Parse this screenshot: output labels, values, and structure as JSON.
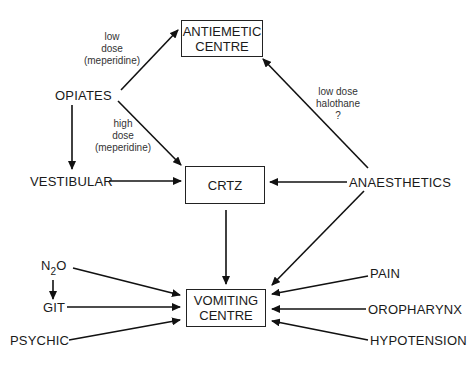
{
  "diagram": {
    "type": "flow",
    "boxes": {
      "antiemetic": {
        "line1": "ANTIEMETIC",
        "line2": "CENTRE"
      },
      "crtz": {
        "label": "CRTZ"
      },
      "vomiting": {
        "line1": "VOMITING",
        "line2": "CENTRE"
      }
    },
    "nodes": {
      "opiates": "OPIATES",
      "vestibular": "VESTIBULAR",
      "anaesthetics": "ANAESTHETICS",
      "n2o_n": "N",
      "n2o_sub": "2",
      "n2o_o": "O",
      "git": "GIT",
      "psychic": "PSYCHIC",
      "pain": "PAIN",
      "oropharynx": "OROPHARYNX",
      "hypotension": "HYPOTENSION"
    },
    "annotations": {
      "low_dose": {
        "l1": "low",
        "l2": "dose",
        "l3": "(meperidine)"
      },
      "high_dose": {
        "l1": "high",
        "l2": "dose",
        "l3": "(meperidine)"
      },
      "halothane": {
        "l1": "low dose",
        "l2": "halothane",
        "l3": "?"
      }
    },
    "edges": [
      {
        "from": "OPIATES",
        "to": "ANTIEMETIC CENTRE",
        "label": "low dose (meperidine)"
      },
      {
        "from": "OPIATES",
        "to": "CRTZ",
        "label": "high dose (meperidine)"
      },
      {
        "from": "OPIATES",
        "to": "VESTIBULAR"
      },
      {
        "from": "VESTIBULAR",
        "to": "CRTZ"
      },
      {
        "from": "ANAESTHETICS",
        "to": "ANTIEMETIC CENTRE",
        "label": "low dose halothane ?"
      },
      {
        "from": "ANAESTHETICS",
        "to": "CRTZ"
      },
      {
        "from": "ANAESTHETICS",
        "to": "VOMITING CENTRE"
      },
      {
        "from": "CRTZ",
        "to": "VOMITING CENTRE"
      },
      {
        "from": "N2O",
        "to": "VOMITING CENTRE"
      },
      {
        "from": "N2O",
        "to": "GIT"
      },
      {
        "from": "GIT",
        "to": "VOMITING CENTRE"
      },
      {
        "from": "PSYCHIC",
        "to": "VOMITING CENTRE"
      },
      {
        "from": "PAIN",
        "to": "VOMITING CENTRE"
      },
      {
        "from": "OROPHARYNX",
        "to": "VOMITING CENTRE"
      },
      {
        "from": "HYPOTENSION",
        "to": "VOMITING CENTRE"
      }
    ]
  }
}
